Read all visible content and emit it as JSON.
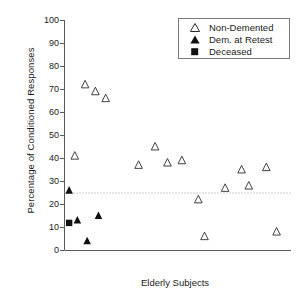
{
  "chart_data": {
    "type": "scatter",
    "title": "",
    "xlabel": "Elderly Subjects",
    "ylabel": "Percentage of Conditioned Responses",
    "ylim": [
      0,
      100
    ],
    "yticks": [
      0,
      10,
      20,
      30,
      40,
      50,
      60,
      70,
      80,
      90,
      100
    ],
    "xlim": [
      0,
      22
    ],
    "xticks": [],
    "grid": false,
    "legend_position": "top-right",
    "reference_line": {
      "orientation": "horizontal",
      "value": 25,
      "style": "dotted"
    },
    "series": [
      {
        "name": "Non-Demented",
        "marker": "open-triangle",
        "color": "#000000",
        "points": [
          {
            "x": 1.0,
            "y": 41
          },
          {
            "x": 2.0,
            "y": 72
          },
          {
            "x": 3.0,
            "y": 69
          },
          {
            "x": 4.0,
            "y": 66
          },
          {
            "x": 7.2,
            "y": 37
          },
          {
            "x": 8.8,
            "y": 45
          },
          {
            "x": 10.0,
            "y": 38
          },
          {
            "x": 11.4,
            "y": 39
          },
          {
            "x": 13.0,
            "y": 22
          },
          {
            "x": 13.6,
            "y": 6
          },
          {
            "x": 15.6,
            "y": 27
          },
          {
            "x": 17.2,
            "y": 35
          },
          {
            "x": 17.9,
            "y": 28
          },
          {
            "x": 19.6,
            "y": 36
          },
          {
            "x": 20.6,
            "y": 8
          }
        ]
      },
      {
        "name": "Dem. at Retest",
        "marker": "filled-triangle",
        "color": "#000000",
        "points": [
          {
            "x": 0.45,
            "y": 26
          },
          {
            "x": 1.25,
            "y": 13
          },
          {
            "x": 2.2,
            "y": 4
          },
          {
            "x": 3.3,
            "y": 15
          }
        ]
      },
      {
        "name": "Deceased",
        "marker": "filled-square",
        "color": "#000000",
        "points": [
          {
            "x": 0.45,
            "y": 12
          }
        ]
      }
    ]
  },
  "axes": {
    "y_title": "Percentage of Conditioned Responses",
    "x_title": "Elderly Subjects",
    "y_tick_labels": [
      "100",
      "90",
      "80",
      "70",
      "60",
      "50",
      "40",
      "30",
      "20",
      "10",
      "0"
    ]
  },
  "legend": {
    "entries": [
      {
        "label": "Non-Demented",
        "marker": "open-triangle"
      },
      {
        "label": "Dem. at Retest",
        "marker": "filled-triangle"
      },
      {
        "label": "Deceased",
        "marker": "filled-square"
      }
    ]
  },
  "colors": {
    "axis": "#5a5a5a",
    "marker": "#2b2b2b",
    "reference_line": "#9a9a9a",
    "legend_border": "#7a7a7a"
  }
}
